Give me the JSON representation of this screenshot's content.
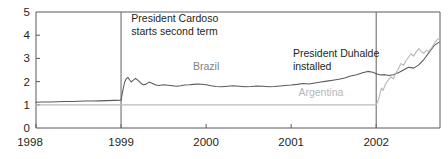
{
  "chart_data": {
    "type": "line",
    "title": "",
    "subtitle": "",
    "xlabel": "",
    "ylabel": "",
    "xlim": [
      1998.0,
      2002.75
    ],
    "ylim": [
      0,
      5
    ],
    "xticks": [
      1998,
      1999,
      2000,
      2001,
      2002
    ],
    "xticklabels": [
      "1998",
      "1999",
      "2000",
      "2001",
      "2002"
    ],
    "yticks": [
      0,
      1,
      2,
      3,
      4,
      5
    ],
    "yticklabels": [
      "0",
      "1",
      "2",
      "3",
      "4",
      "5"
    ],
    "grid": false,
    "legend_position": "inline-labels",
    "annotations": [
      {
        "id": "cardoso",
        "text_lines": [
          "President Cardoso",
          "starts second term"
        ],
        "x": 1999.05,
        "y": 4.55
      },
      {
        "id": "duhalde",
        "text_lines": [
          "President Duhalde",
          "installed"
        ],
        "x": 2000.95,
        "y": 3.05
      }
    ],
    "event_lines": [
      {
        "id": "event-1999",
        "x": 1999.0
      },
      {
        "id": "event-2002",
        "x": 2002.0
      }
    ],
    "series": [
      {
        "name": "Brazil",
        "color": "#58595b",
        "label_x": 2000.0,
        "label_y": 2.48,
        "x": [
          1998.0,
          1998.08,
          1998.17,
          1998.25,
          1998.33,
          1998.42,
          1998.5,
          1998.58,
          1998.67,
          1998.75,
          1998.83,
          1998.92,
          1999.0,
          1999.02,
          1999.04,
          1999.06,
          1999.08,
          1999.1,
          1999.12,
          1999.14,
          1999.17,
          1999.2,
          1999.23,
          1999.26,
          1999.29,
          1999.33,
          1999.37,
          1999.41,
          1999.45,
          1999.5,
          1999.55,
          1999.6,
          1999.65,
          1999.7,
          1999.75,
          1999.8,
          1999.85,
          1999.9,
          1999.95,
          2000.0,
          2000.06,
          2000.12,
          2000.18,
          2000.25,
          2000.32,
          2000.39,
          2000.46,
          2000.53,
          2000.6,
          2000.67,
          2000.74,
          2000.8,
          2000.87,
          2000.93,
          2001.0,
          2001.07,
          2001.14,
          2001.21,
          2001.28,
          2001.35,
          2001.42,
          2001.49,
          2001.56,
          2001.63,
          2001.7,
          2001.77,
          2001.84,
          2001.9,
          2001.96,
          2002.0,
          2002.05,
          2002.1,
          2002.15,
          2002.2,
          2002.26,
          2002.32,
          2002.38,
          2002.44,
          2002.5,
          2002.56,
          2002.62,
          2002.68,
          2002.74
        ],
        "y": [
          1.11,
          1.12,
          1.12,
          1.13,
          1.14,
          1.14,
          1.15,
          1.16,
          1.16,
          1.17,
          1.18,
          1.19,
          1.2,
          1.6,
          1.95,
          2.12,
          2.18,
          2.08,
          1.98,
          2.05,
          2.14,
          2.05,
          1.94,
          1.86,
          1.88,
          1.98,
          1.92,
          1.85,
          1.83,
          1.86,
          1.84,
          1.82,
          1.8,
          1.82,
          1.85,
          1.86,
          1.88,
          1.9,
          1.89,
          1.86,
          1.82,
          1.79,
          1.78,
          1.8,
          1.82,
          1.8,
          1.78,
          1.79,
          1.81,
          1.8,
          1.78,
          1.79,
          1.81,
          1.83,
          1.85,
          1.88,
          1.92,
          1.9,
          1.94,
          1.98,
          2.02,
          2.06,
          2.1,
          2.16,
          2.24,
          2.3,
          2.38,
          2.44,
          2.4,
          2.34,
          2.28,
          2.3,
          2.26,
          2.3,
          2.38,
          2.5,
          2.62,
          2.58,
          2.72,
          2.95,
          3.25,
          3.55,
          3.7
        ]
      },
      {
        "name": "Argentina",
        "color": "#b8babc",
        "label_x": 2001.35,
        "label_y": 1.4,
        "x": [
          1998.0,
          1998.25,
          1998.5,
          1998.75,
          1999.0,
          1999.25,
          1999.5,
          1999.75,
          2000.0,
          2000.25,
          2000.5,
          2000.75,
          2001.0,
          2001.25,
          2001.5,
          2001.75,
          2001.9,
          2002.0,
          2002.02,
          2002.04,
          2002.06,
          2002.08,
          2002.11,
          2002.14,
          2002.17,
          2002.2,
          2002.23,
          2002.26,
          2002.29,
          2002.32,
          2002.35,
          2002.38,
          2002.41,
          2002.44,
          2002.47,
          2002.5,
          2002.53,
          2002.56,
          2002.59,
          2002.62,
          2002.65,
          2002.68,
          2002.71,
          2002.74
        ],
        "y": [
          1.0,
          1.0,
          1.0,
          1.0,
          1.0,
          1.0,
          1.0,
          1.0,
          1.0,
          1.0,
          1.0,
          1.0,
          1.0,
          1.0,
          1.0,
          1.0,
          1.0,
          1.0,
          1.15,
          1.4,
          1.72,
          1.62,
          1.9,
          2.05,
          2.2,
          2.12,
          2.35,
          2.55,
          2.78,
          2.7,
          2.9,
          3.05,
          3.2,
          3.1,
          3.28,
          3.42,
          3.3,
          3.22,
          3.35,
          3.3,
          3.45,
          3.62,
          3.78,
          3.86
        ]
      }
    ]
  }
}
